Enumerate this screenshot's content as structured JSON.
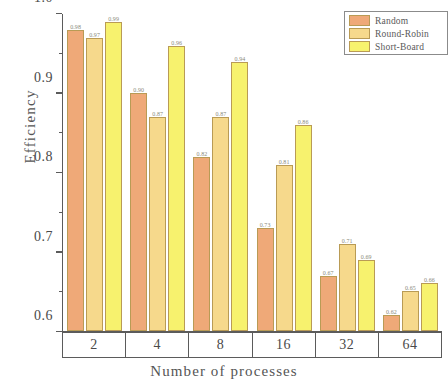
{
  "chart_data": {
    "type": "bar",
    "title": "",
    "xlabel": "Number of processes",
    "ylabel": "Efficiency",
    "categories": [
      "2",
      "4",
      "8",
      "16",
      "32",
      "64"
    ],
    "ylim": [
      0.6,
      1.0
    ],
    "ytick_labels": [
      "0.6",
      "0.7",
      "0.8",
      "0.9",
      "1.0"
    ],
    "ytick_values": [
      0.6,
      0.7,
      0.8,
      0.9,
      1.0
    ],
    "yminor_values": [
      0.65,
      0.75,
      0.85,
      0.95
    ],
    "grid": false,
    "legend_position": "top-right",
    "series": [
      {
        "name": "Random",
        "color": "#EFA978",
        "values": [
          0.98,
          0.9,
          0.82,
          0.73,
          0.67,
          0.62
        ],
        "labels": [
          "0.98",
          "0.90",
          "0.82",
          "0.73",
          "0.67",
          "0.62"
        ]
      },
      {
        "name": "Round-Robin",
        "color": "#F6D98C",
        "values": [
          0.97,
          0.87,
          0.87,
          0.81,
          0.71,
          0.65
        ],
        "labels": [
          "0.97",
          "0.87",
          "0.87",
          "0.81",
          "0.71",
          "0.65"
        ]
      },
      {
        "name": "Short-Board",
        "color": "#F7F26E",
        "values": [
          0.99,
          0.96,
          0.94,
          0.86,
          0.69,
          0.66
        ],
        "labels": [
          "0.99",
          "0.96",
          "0.94",
          "0.86",
          "0.69",
          "0.66"
        ]
      }
    ]
  }
}
